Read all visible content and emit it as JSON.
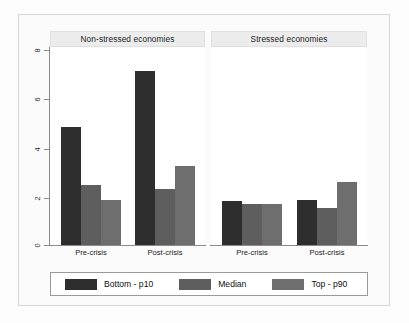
{
  "chart_data": {
    "type": "bar",
    "title": "",
    "xlabel": "",
    "ylabel": "",
    "ylim": [
      0,
      8
    ],
    "yticks": [
      "0",
      "2",
      "4",
      "6",
      "8"
    ],
    "grid": true,
    "legend_position": "bottom",
    "panels": [
      {
        "title": "Non-stressed economies",
        "categories": [
          "Pre-crisis",
          "Post-crisis"
        ],
        "series": [
          {
            "name": "Bottom - p10",
            "values": [
              4.85,
              7.15
            ]
          },
          {
            "name": "Median",
            "values": [
              2.45,
              2.3
            ]
          },
          {
            "name": "Top - p90",
            "values": [
              1.85,
              3.25
            ]
          }
        ]
      },
      {
        "title": "Stressed economies",
        "categories": [
          "Pre-crisis",
          "Post-crisis"
        ],
        "series": [
          {
            "name": "Bottom - p10",
            "values": [
              1.8,
              1.85
            ]
          },
          {
            "name": "Median",
            "values": [
              1.68,
              1.52
            ]
          },
          {
            "name": "Top - p90",
            "values": [
              1.68,
              2.58
            ]
          }
        ]
      }
    ],
    "legend": [
      {
        "label": "Bottom - p10",
        "color": "#2e2e2e"
      },
      {
        "label": "Median",
        "color": "#5e5e5e"
      },
      {
        "label": "Top - p90",
        "color": "#6e6e6e"
      }
    ]
  },
  "panel_left": {
    "title": "Non-stressed economies",
    "cat1": "Pre-crisis",
    "cat2": "Post-crisis"
  },
  "panel_right": {
    "title": "Stressed economies",
    "cat1": "Pre-crisis",
    "cat2": "Post-crisis"
  },
  "axis": {
    "t0": "0",
    "t2": "2",
    "t4": "4",
    "t6": "6",
    "t8": "8"
  },
  "legend": {
    "p10": "Bottom - p10",
    "median": "Median",
    "p90": "Top - p90"
  }
}
